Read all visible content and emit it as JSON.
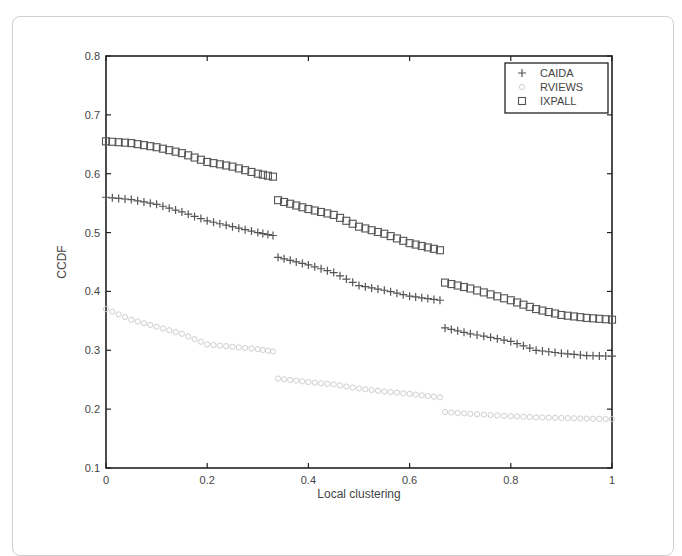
{
  "chart_data": {
    "type": "scatter",
    "title": "",
    "xlabel": "Local clustering",
    "ylabel": "CCDF",
    "xlim": [
      0,
      1
    ],
    "ylim": [
      0.1,
      0.8
    ],
    "xticks": [
      0,
      0.2,
      0.4,
      0.6,
      0.8,
      1
    ],
    "xtick_labels": [
      "0",
      "0.2",
      "0.4",
      "0.6",
      "0.8",
      "1"
    ],
    "yticks": [
      0.1,
      0.2,
      0.3,
      0.4,
      0.5,
      0.6,
      0.7,
      0.8
    ],
    "ytick_labels": [
      "0.1",
      "0.2",
      "0.3",
      "0.4",
      "0.5",
      "0.6",
      "0.7",
      "0.8"
    ],
    "grid": false,
    "legend_position": "upper right",
    "series": [
      {
        "name": "CAIDA",
        "marker": "plus",
        "color": "#555555",
        "segments": [
          {
            "x": [
              0,
              0.05,
              0.1,
              0.15,
              0.2,
              0.25,
              0.3,
              0.33
            ],
            "y": [
              0.56,
              0.556,
              0.548,
              0.535,
              0.52,
              0.51,
              0.5,
              0.495
            ]
          },
          {
            "x": [
              0.34,
              0.4,
              0.45,
              0.5,
              0.55,
              0.6,
              0.66
            ],
            "y": [
              0.458,
              0.445,
              0.432,
              0.41,
              0.402,
              0.392,
              0.385
            ]
          },
          {
            "x": [
              0.67,
              0.72,
              0.76,
              0.8,
              0.85,
              0.9,
              0.95,
              1.0
            ],
            "y": [
              0.338,
              0.328,
              0.322,
              0.315,
              0.3,
              0.295,
              0.291,
              0.29
            ]
          }
        ]
      },
      {
        "name": "RVIEWS",
        "marker": "circle",
        "color": "#c8c8c8",
        "segments": [
          {
            "x": [
              0,
              0.05,
              0.1,
              0.15,
              0.2,
              0.25,
              0.3,
              0.33
            ],
            "y": [
              0.37,
              0.352,
              0.34,
              0.328,
              0.31,
              0.306,
              0.302,
              0.298
            ]
          },
          {
            "x": [
              0.34,
              0.4,
              0.45,
              0.5,
              0.55,
              0.6,
              0.66
            ],
            "y": [
              0.252,
              0.246,
              0.242,
              0.235,
              0.23,
              0.226,
              0.22
            ]
          },
          {
            "x": [
              0.67,
              0.72,
              0.76,
              0.8,
              0.85,
              0.9,
              0.95,
              1.0
            ],
            "y": [
              0.195,
              0.192,
              0.19,
              0.188,
              0.186,
              0.185,
              0.184,
              0.183
            ]
          }
        ]
      },
      {
        "name": "IXPALL",
        "marker": "square",
        "color": "#555555",
        "segments": [
          {
            "x": [
              0,
              0.05,
              0.1,
              0.15,
              0.2,
              0.25,
              0.3,
              0.33
            ],
            "y": [
              0.655,
              0.652,
              0.645,
              0.635,
              0.62,
              0.612,
              0.6,
              0.595
            ]
          },
          {
            "x": [
              0.34,
              0.4,
              0.45,
              0.5,
              0.55,
              0.6,
              0.66
            ],
            "y": [
              0.555,
              0.54,
              0.53,
              0.51,
              0.498,
              0.482,
              0.47
            ]
          },
          {
            "x": [
              0.67,
              0.72,
              0.76,
              0.8,
              0.85,
              0.9,
              0.95,
              1.0
            ],
            "y": [
              0.415,
              0.405,
              0.395,
              0.385,
              0.37,
              0.36,
              0.355,
              0.352
            ]
          }
        ]
      }
    ]
  }
}
